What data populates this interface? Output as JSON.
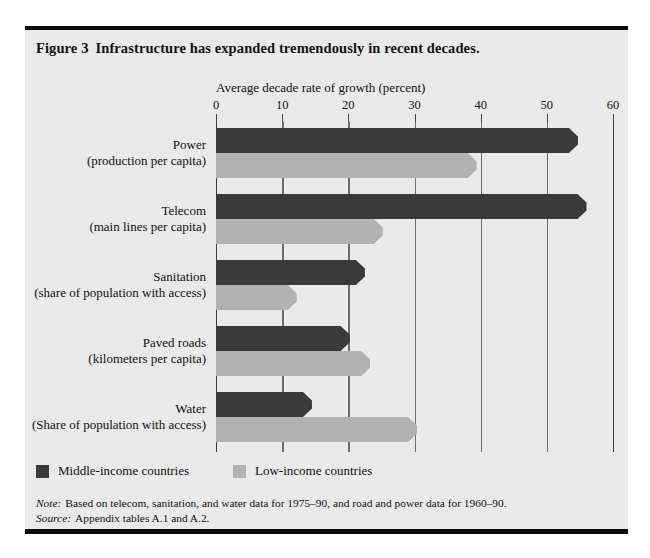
{
  "figure": {
    "number_label": "Figure 3",
    "title": "Infrastructure has expanded tremendously in recent decades."
  },
  "notes": {
    "note_lead": "Note:",
    "note_text": "Based on telecom, sanitation, and water data for 1975–90, and road and power data for 1960–90.",
    "source_lead": "Source:",
    "source_text": "Appendix tables A.1 and A.2."
  },
  "legend": {
    "position": "bottom-left",
    "items": [
      {
        "label": "Middle-income countries",
        "color": "#3a3a3a",
        "swatch": "dark"
      },
      {
        "label": "Low-income countries",
        "color": "#b2b2b2",
        "swatch": "light"
      }
    ]
  },
  "chart_data": {
    "type": "bar",
    "orientation": "horizontal",
    "title": "Infrastructure has expanded tremendously in recent decades.",
    "xlabel": "Average decade rate of growth (percent)",
    "ylabel": "",
    "xlim": [
      0,
      60
    ],
    "xticks": [
      0,
      10,
      20,
      30,
      40,
      50,
      60
    ],
    "xtick_labels": [
      "0",
      "10",
      "20",
      "30",
      "40",
      "50",
      "60"
    ],
    "grid": "vertical",
    "categories": [
      {
        "line1": "Power",
        "line2": "(production per capita)"
      },
      {
        "line1": "Telecom",
        "line2": "(main lines per capita)"
      },
      {
        "line1": "Sanitation",
        "line2": "(share of population with access)"
      },
      {
        "line1": "Paved roads",
        "line2": "(kilometers per capita)"
      },
      {
        "line1": "Water",
        "line2": "(Share of population with access)"
      }
    ],
    "series": [
      {
        "name": "Middle-income countries",
        "color": "#3a3a3a",
        "values": [
          54.7,
          56.0,
          22.5,
          20.2,
          14.5
        ]
      },
      {
        "name": "Low-income countries",
        "color": "#b2b2b2",
        "values": [
          39.4,
          25.2,
          12.2,
          23.3,
          30.4
        ]
      }
    ]
  }
}
